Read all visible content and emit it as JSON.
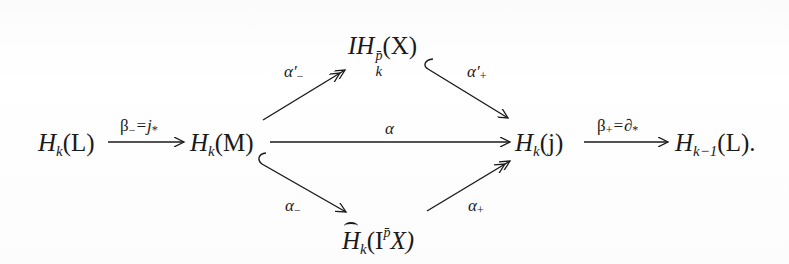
{
  "diagram": {
    "type": "commutative-diagram",
    "nodes": {
      "hkl": {
        "base": "H",
        "sub": "k",
        "arg": "(L)"
      },
      "hkm": {
        "base": "H",
        "sub": "k",
        "arg": "(M)"
      },
      "ih": {
        "pre": "I",
        "base": "H",
        "sub": "k",
        "sup": "p̄",
        "arg": "(X)"
      },
      "hkj": {
        "base": "H",
        "sub": "k",
        "arg": "(j)"
      },
      "htilde": {
        "base": "H",
        "sub": "k",
        "arg_open": "(I",
        "sup": "p̄",
        "arg_close": "X)"
      },
      "hk1l": {
        "base": "H",
        "sub": "k−1",
        "arg": "(L)."
      }
    },
    "arrows": {
      "beta_minus": {
        "label": "β",
        "sub": "−",
        "rest": "=j",
        "rest_sub": "*"
      },
      "alpha": {
        "label": "α"
      },
      "beta_plus": {
        "label": "β",
        "sub": "+",
        "rest": "=∂",
        "rest_sub": "*"
      },
      "alpha_prime_minus": {
        "label": "α′",
        "sub": "−"
      },
      "alpha_prime_plus": {
        "label": "α′",
        "sub": "+"
      },
      "alpha_minus": {
        "label": "α",
        "sub": "−"
      },
      "alpha_plus": {
        "label": "α",
        "sub": "+"
      }
    }
  }
}
